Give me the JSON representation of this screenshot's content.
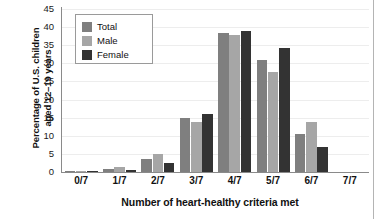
{
  "chart_data": {
    "type": "bar",
    "title": "",
    "xlabel": "Number of heart-healthy criteria met",
    "ylabel": "Percentage of U.S. children aged 12–19 years",
    "ylabel_line1": "Percentage of U.S. children",
    "ylabel_line2": "aged 12–19 years",
    "categories": [
      "0/7",
      "1/7",
      "2/7",
      "3/7",
      "4/7",
      "5/7",
      "6/7",
      "7/7"
    ],
    "series": [
      {
        "name": "Total",
        "color": "#7f7f7f",
        "values": [
          0.2,
          0.7,
          3.5,
          15.0,
          38.4,
          30.8,
          10.4,
          0
        ]
      },
      {
        "name": "Male",
        "color": "#a6a6a6",
        "values": [
          0.1,
          1.3,
          4.9,
          13.7,
          37.7,
          27.7,
          13.8,
          0
        ]
      },
      {
        "name": "Female",
        "color": "#333333",
        "values": [
          0.3,
          0.5,
          2.4,
          16.1,
          39.0,
          34.2,
          6.8,
          0
        ]
      }
    ],
    "yticks": [
      0,
      5,
      10,
      15,
      20,
      25,
      30,
      35,
      40,
      45
    ],
    "ytick_labels": [
      "0",
      "5",
      "10",
      "15",
      "20",
      "25",
      "30",
      "35",
      "40",
      "45"
    ],
    "ylim": [
      0,
      45
    ],
    "grid": true,
    "grid_axis": "y",
    "legend_position": "upper-left",
    "legend_entries": [
      "Total",
      "Male",
      "Female"
    ]
  },
  "legend": {
    "items": [
      {
        "label": "Total"
      },
      {
        "label": "Male"
      },
      {
        "label": "Female"
      }
    ]
  }
}
